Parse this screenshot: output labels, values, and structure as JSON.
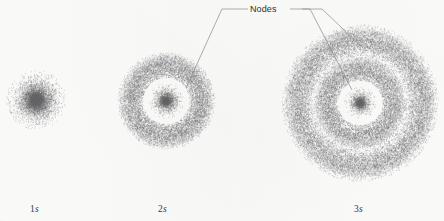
{
  "figure": {
    "background_color": "#fcfcfb",
    "dot_color": "#6e6e72",
    "leader_line_color": "#8d8d93"
  },
  "annotation": {
    "label": "Nodes",
    "text_x": 250,
    "text_y": 5,
    "leaders": [
      {
        "name": "leader-to-2s-node",
        "points": "248,9 222,9 186,88"
      },
      {
        "name": "leader-to-3s-outer-node",
        "points": "290,9 310,9 352,90"
      },
      {
        "name": "leader-to-3s-inner-node",
        "points": "302,9 322,9 363,48"
      }
    ]
  },
  "orbitals": [
    {
      "id": "1s",
      "label_principal": "1",
      "label_subshell": "s",
      "label_x": 30,
      "label_y": 205,
      "center_x": 36,
      "center_y": 100,
      "outer_radius": 30,
      "nodes": 0,
      "shells": [
        {
          "name": "core",
          "inner_radius": 0,
          "outer_radius": 30,
          "peak_radius": 0,
          "density": 1.0
        }
      ]
    },
    {
      "id": "2s",
      "label_principal": "2",
      "label_subshell": "s",
      "label_x": 158,
      "label_y": 205,
      "center_x": 166,
      "center_y": 101,
      "outer_radius": 46,
      "nodes": 1,
      "node_radii": [
        25
      ],
      "shells": [
        {
          "name": "core",
          "inner_radius": 0,
          "outer_radius": 18,
          "peak_radius": 0,
          "density": 0.95
        },
        {
          "name": "shell-1",
          "inner_radius": 25,
          "outer_radius": 46,
          "peak_radius": 35,
          "density": 0.85
        }
      ]
    },
    {
      "id": "3s",
      "label_principal": "3",
      "label_subshell": "s",
      "label_x": 354,
      "label_y": 205,
      "center_x": 360,
      "center_y": 103,
      "outer_radius": 74,
      "nodes": 2,
      "node_radii": [
        24,
        51
      ],
      "shells": [
        {
          "name": "core",
          "inner_radius": 0,
          "outer_radius": 16,
          "peak_radius": 0,
          "density": 0.95
        },
        {
          "name": "shell-1",
          "inner_radius": 24,
          "outer_radius": 45,
          "peak_radius": 34,
          "density": 0.8
        },
        {
          "name": "shell-2",
          "inner_radius": 51,
          "outer_radius": 74,
          "peak_radius": 62,
          "density": 0.72
        }
      ]
    }
  ],
  "chart_data": {
    "type": "scatter",
    "xlabel": "",
    "ylabel": "",
    "annotations": [
      "Nodes"
    ],
    "categories": [
      "1s",
      "2s",
      "3s"
    ],
    "series": [
      {
        "name": "1s",
        "center": [
          36,
          100
        ],
        "radial_maxima": [
          0
        ],
        "radial_nodes": [],
        "outer_radius": 30,
        "node_count": 0
      },
      {
        "name": "2s",
        "center": [
          166,
          101
        ],
        "radial_maxima": [
          0,
          35
        ],
        "radial_nodes": [
          25
        ],
        "outer_radius": 46,
        "node_count": 1
      },
      {
        "name": "3s",
        "center": [
          360,
          103
        ],
        "radial_maxima": [
          0,
          34,
          62
        ],
        "radial_nodes": [
          24,
          51
        ],
        "outer_radius": 74,
        "node_count": 2
      }
    ]
  }
}
